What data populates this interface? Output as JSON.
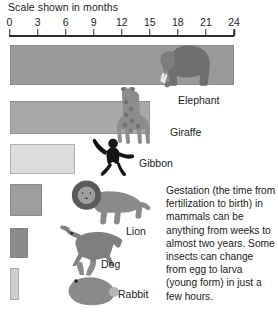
{
  "chart_data": {
    "type": "bar",
    "title": "Scale shown in months",
    "xlabel": "months",
    "ylabel": "",
    "xlim": [
      0,
      24
    ],
    "grid": false,
    "legend": false,
    "orientation": "horizontal",
    "axis_ticks": [
      0,
      3,
      6,
      9,
      12,
      15,
      18,
      21,
      24
    ],
    "axis_tick_labels": [
      "0",
      "3",
      "6",
      "9",
      "12",
      "15",
      "18",
      "21",
      "24"
    ],
    "categories": [
      "Elephant",
      "Giraffe",
      "Gibbon",
      "Lion",
      "Dog",
      "Rabbit"
    ],
    "values": [
      24,
      15,
      7,
      3.5,
      2,
      1
    ],
    "units": "months",
    "annotation": "Gestation (the time from fertilization to birth) in mammals can be anything from weeks to almost two years. Some insects can change from egg to larva (young form) in just a few hours."
  },
  "chart": {
    "title": "Scale shown in months",
    "axis": {
      "ticks": [
        {
          "label": "0",
          "value": 0
        },
        {
          "label": "3",
          "value": 3
        },
        {
          "label": "6",
          "value": 6
        },
        {
          "label": "9",
          "value": 9
        },
        {
          "label": "12",
          "value": 12
        },
        {
          "label": "15",
          "value": 15
        },
        {
          "label": "18",
          "value": 18
        },
        {
          "label": "21",
          "value": 21
        },
        {
          "label": "24",
          "value": 24
        }
      ]
    },
    "rows": [
      {
        "label": "Elephant",
        "value": 24,
        "icon": "elephant-icon",
        "color": "#9a9a9a"
      },
      {
        "label": "Giraffe",
        "value": 15,
        "icon": "giraffe-icon",
        "color": "#a8a8a8"
      },
      {
        "label": "Gibbon",
        "value": 7,
        "icon": "gibbon-icon",
        "color": "#dcdcdc"
      },
      {
        "label": "Lion",
        "value": 3.5,
        "icon": "lion-icon",
        "color": "#9d9d9d"
      },
      {
        "label": "Dog",
        "value": 2,
        "icon": "dog-icon",
        "color": "#8b8b8b"
      },
      {
        "label": "Rabbit",
        "value": 1,
        "icon": "rabbit-icon",
        "color": "#cfcfcf"
      }
    ],
    "caption": "Gestation (the time from fertilization to birth) in mammals can be anything from weeks to almost two years. Some insects can change from egg to larva (young form) in just a few hours."
  }
}
